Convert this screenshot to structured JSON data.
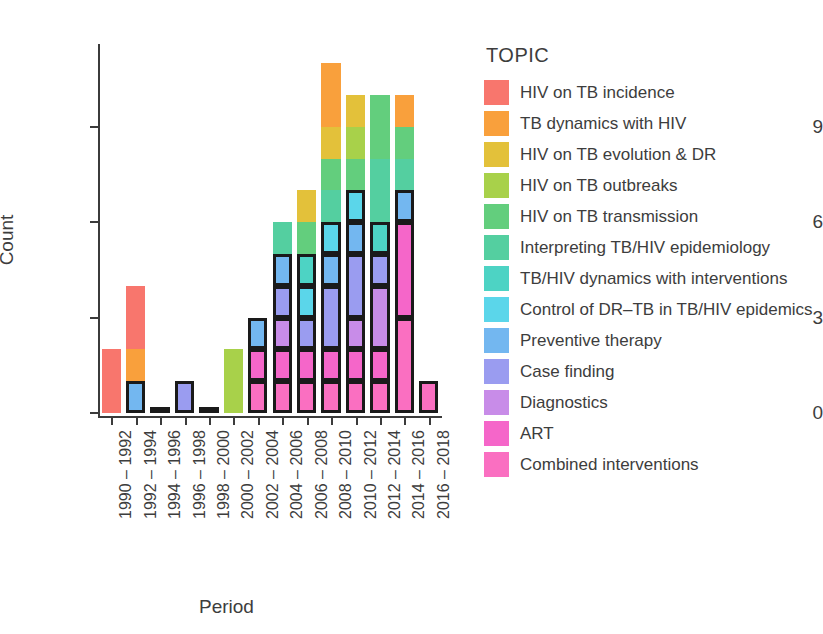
{
  "chart_data": {
    "type": "bar",
    "stacked": true,
    "title": "",
    "xlabel": "Period",
    "ylabel": "Count",
    "ylim": [
      0,
      11.6
    ],
    "yticks": [
      0,
      3,
      6,
      9
    ],
    "grid": false,
    "legend_title": "TOPIC",
    "legend_position": "right",
    "categories": [
      "1990 – 1992",
      "1992 – 1994",
      "1994 – 1996",
      "1996 – 1998",
      "1998 – 2000",
      "2000 – 2002",
      "2002 – 2004",
      "2004 – 2006",
      "2006 – 2008",
      "2008 – 2010",
      "2010 – 2012",
      "2012 – 2014",
      "2014 – 2016",
      "2016 – 2018"
    ],
    "totals": [
      2,
      4,
      0,
      1,
      0,
      2,
      3,
      6,
      6,
      11,
      10,
      11,
      10,
      1
    ],
    "series": [
      {
        "name": "HIV on TB incidence",
        "color": "#F8766D",
        "values": [
          2,
          2,
          0,
          0,
          0,
          0,
          0,
          0,
          0,
          0,
          0,
          0,
          0,
          0
        ]
      },
      {
        "name": "TB dynamics with HIV",
        "color": "#F9A03C",
        "values": [
          0,
          1,
          0,
          0,
          0,
          0,
          0,
          0,
          0,
          2,
          0,
          0,
          1,
          0
        ]
      },
      {
        "name": "HIV on TB evolution & DR",
        "color": "#E3C13A",
        "values": [
          0,
          0,
          0,
          0,
          0,
          0,
          0,
          0,
          1,
          1,
          1,
          0,
          0,
          0
        ]
      },
      {
        "name": "HIV on TB outbreaks",
        "color": "#A8D14A",
        "values": [
          0,
          0,
          0,
          0,
          0,
          2,
          0,
          0,
          0,
          0,
          1,
          0,
          0,
          0
        ]
      },
      {
        "name": "HIV on TB transmission",
        "color": "#63CE7D",
        "values": [
          0,
          0,
          0,
          0,
          0,
          0,
          0,
          0,
          1,
          1,
          1,
          2,
          1,
          0
        ]
      },
      {
        "name": "Interpreting TB/HIV epidemiology",
        "color": "#54CFA0",
        "values": [
          0,
          0,
          0,
          0,
          0,
          0,
          0,
          1,
          0,
          1,
          0,
          2,
          1,
          0
        ]
      },
      {
        "name": "TB/HIV dynamics with interventions",
        "color": "#4DD3C4",
        "values": [
          0,
          0,
          0,
          0,
          0,
          0,
          0,
          0,
          1,
          0,
          0,
          1,
          0,
          0
        ]
      },
      {
        "name": "Control of DR–TB in TB/HIV epidemics",
        "color": "#5BD6EA",
        "values": [
          0,
          0,
          0,
          0,
          0,
          0,
          0,
          0,
          1,
          1,
          1,
          0,
          0,
          0
        ]
      },
      {
        "name": "Preventive therapy",
        "color": "#73B7F0",
        "values": [
          0,
          1,
          0,
          0,
          0,
          0,
          1,
          1,
          0,
          1,
          1,
          0,
          1,
          0
        ]
      },
      {
        "name": "Case finding",
        "color": "#9A9CF0",
        "values": [
          0,
          0,
          0,
          1,
          0,
          0,
          0,
          1,
          1,
          2,
          2,
          1,
          0,
          0
        ]
      },
      {
        "name": "Diagnostics",
        "color": "#C88CE8",
        "values": [
          0,
          0,
          0,
          0,
          0,
          0,
          0,
          1,
          0,
          0,
          1,
          2,
          0,
          0
        ]
      },
      {
        "name": "ART",
        "color": "#F566C9",
        "values": [
          0,
          0,
          0,
          0,
          0,
          0,
          1,
          1,
          1,
          1,
          1,
          1,
          3,
          0
        ]
      },
      {
        "name": "Combined interventions",
        "color": "#FA6FC1",
        "values": [
          0,
          0,
          0,
          0,
          0,
          0,
          1,
          1,
          1,
          1,
          1,
          1,
          3,
          1
        ]
      }
    ]
  },
  "axes": {
    "ylabel": "Count",
    "xlabel": "Period",
    "ytick_labels": [
      "9",
      "6",
      "3",
      "0"
    ]
  },
  "legend": {
    "title": "TOPIC",
    "items": [
      {
        "label": "HIV on TB incidence",
        "color": "#F8766D"
      },
      {
        "label": "TB dynamics with HIV",
        "color": "#F9A03C"
      },
      {
        "label": "HIV on TB evolution & DR",
        "color": "#E3C13A"
      },
      {
        "label": "HIV on TB outbreaks",
        "color": "#A8D14A"
      },
      {
        "label": "HIV on TB transmission",
        "color": "#63CE7D"
      },
      {
        "label": "Interpreting TB/HIV epidemiology",
        "color": "#54CFA0"
      },
      {
        "label": "TB/HIV dynamics with interventions",
        "color": "#4DD3C4"
      },
      {
        "label": "Control of DR–TB in TB/HIV epidemics",
        "color": "#5BD6EA"
      },
      {
        "label": "Preventive therapy",
        "color": "#73B7F0"
      },
      {
        "label": "Case finding",
        "color": "#9A9CF0"
      },
      {
        "label": "Diagnostics",
        "color": "#C88CE8"
      },
      {
        "label": "ART",
        "color": "#F566C9"
      },
      {
        "label": "Combined interventions",
        "color": "#FA6FC1"
      }
    ]
  }
}
